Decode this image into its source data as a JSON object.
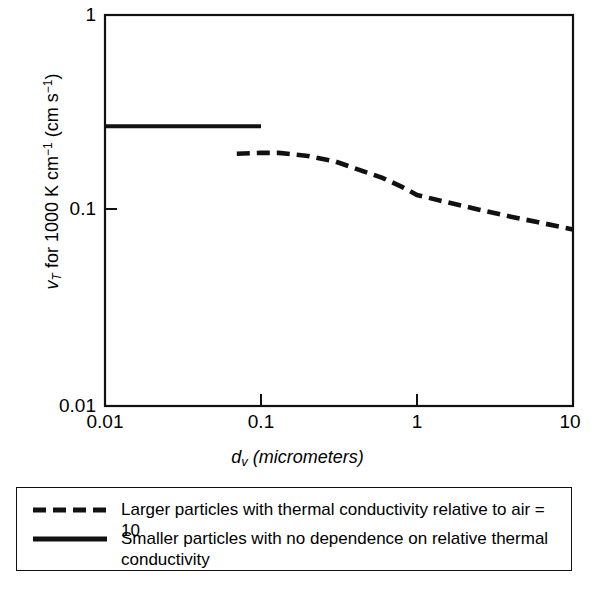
{
  "figure": {
    "background": "#ffffff",
    "ink_color": "#111111"
  },
  "axes": {
    "x": {
      "label_plain": "d_v (micrometers)",
      "label_symbol": "d",
      "label_subscript": "v",
      "label_unit": "(micrometers)",
      "scale": "log",
      "min": 0.01,
      "max": 10,
      "ticks": [
        "0.01",
        "0.1",
        "1",
        "10"
      ],
      "tick_values": [
        0.01,
        0.1,
        1,
        10
      ]
    },
    "y": {
      "label_symbol": "v",
      "label_subscript": "T",
      "label_rest": " for 1000 K cm",
      "label_exp1": "−1",
      "label_unit_open": " (cm s",
      "label_exp2": "−1",
      "label_unit_close": ")",
      "label_plain": "v_T for 1000 K cm^-1 (cm s^-1)",
      "scale": "log",
      "min": 0.01,
      "max": 1,
      "ticks": [
        "1",
        "0.1",
        "0.01"
      ],
      "tick_values": [
        1,
        0.1,
        0.01
      ]
    }
  },
  "legend": {
    "items": [
      {
        "style": "dashed",
        "label": "Larger particles with thermal conductivity relative to air = 10"
      },
      {
        "style": "solid",
        "label": "Smaller particles with no dependence on relative thermal conductivity"
      }
    ]
  },
  "chart_data": {
    "type": "line",
    "title": "",
    "xlabel": "d_v (micrometers)",
    "ylabel": "v_T for 1000 K cm^-1 (cm s^-1)",
    "xscale": "log",
    "yscale": "log",
    "xlim": [
      0.01,
      10
    ],
    "ylim": [
      0.01,
      1
    ],
    "grid": false,
    "legend_position": "below-plot",
    "series": [
      {
        "name": "Smaller particles with no dependence on relative thermal conductivity",
        "style": "solid",
        "color": "#111111",
        "x": [
          0.01,
          0.02,
          0.05,
          0.1
        ],
        "y": [
          0.27,
          0.27,
          0.27,
          0.27
        ]
      },
      {
        "name": "Larger particles with thermal conductivity relative to air = 10",
        "style": "dashed",
        "color": "#111111",
        "x": [
          0.07,
          0.1,
          0.13,
          0.2,
          0.3,
          0.45,
          0.6,
          0.8,
          1.0,
          1.5,
          2.5,
          4.0,
          6.0,
          10.0
        ],
        "y": [
          0.195,
          0.197,
          0.197,
          0.19,
          0.178,
          0.159,
          0.147,
          0.132,
          0.12,
          0.111,
          0.101,
          0.093,
          0.087,
          0.08
        ]
      }
    ]
  }
}
